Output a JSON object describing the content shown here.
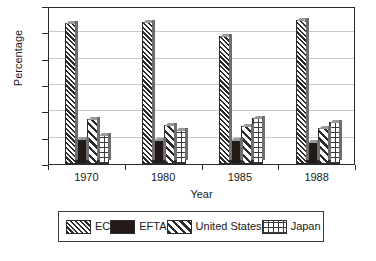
{
  "chart_data": {
    "type": "bar",
    "title": "",
    "xlabel": "Year",
    "ylabel": "Percentage",
    "categories": [
      "1970",
      "1980",
      "1985",
      "1988"
    ],
    "series": [
      {
        "name": "EC",
        "pattern": "diagonal-hatch-dense",
        "values": [
          53.5,
          54.0,
          48.5,
          54.5
        ]
      },
      {
        "name": "EFTA",
        "pattern": "solid-dark",
        "values": [
          9.5,
          9.0,
          9.0,
          8.5
        ]
      },
      {
        "name": "United States",
        "pattern": "diagonal-hatch-wide",
        "values": [
          17.0,
          15.0,
          14.5,
          13.5
        ]
      },
      {
        "name": "Japan",
        "pattern": "grid-crosshatch",
        "values": [
          11.0,
          13.0,
          17.5,
          16.0
        ]
      }
    ],
    "ylim": [
      0,
      60
    ],
    "yticks": [
      0,
      10,
      20,
      30,
      40,
      50,
      60
    ],
    "ytick_labels": [
      "0",
      "10",
      "20",
      "30",
      "40",
      "50",
      "60"
    ],
    "grid": true,
    "grid_axis": "y",
    "legend_position": "below-plot",
    "legend_entries": [
      "EC",
      "EFTA",
      "United States",
      "Japan"
    ],
    "colors": {
      "axis": "#2a2a2a",
      "gridline": "#c9c9c9",
      "bar_outline": "#2d2d2d",
      "hatch": "#2b2b2b",
      "solid_fill": "#241a18",
      "background": "#ffffff",
      "shadow_edge": "#6e6e6e"
    }
  },
  "caption": ""
}
